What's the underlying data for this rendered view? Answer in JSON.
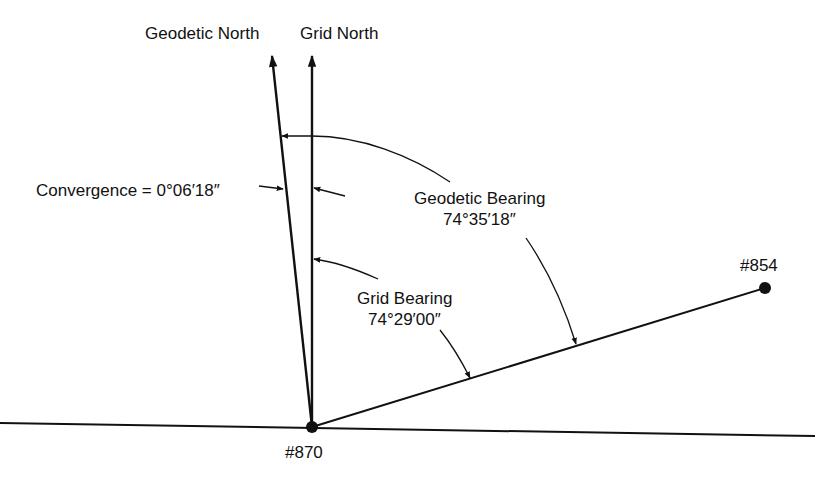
{
  "diagram": {
    "type": "survey bearing / convergence diagram",
    "labels": {
      "geodetic_north": "Geodetic North",
      "grid_north": "Grid North",
      "convergence": "Convergence = 0°06′18″",
      "geodetic_bearing_title": "Geodetic Bearing",
      "geodetic_bearing_value": "74°35′18″",
      "grid_bearing_title": "Grid Bearing",
      "grid_bearing_value": "74°29′00″",
      "station_origin": "#870",
      "station_target": "#854"
    },
    "values": {
      "convergence": "0°06′18″",
      "geodetic_bearing": "74°35′18″",
      "grid_bearing": "74°29′00″"
    },
    "colors": {
      "ink": "#111111",
      "background": "#ffffff"
    }
  }
}
